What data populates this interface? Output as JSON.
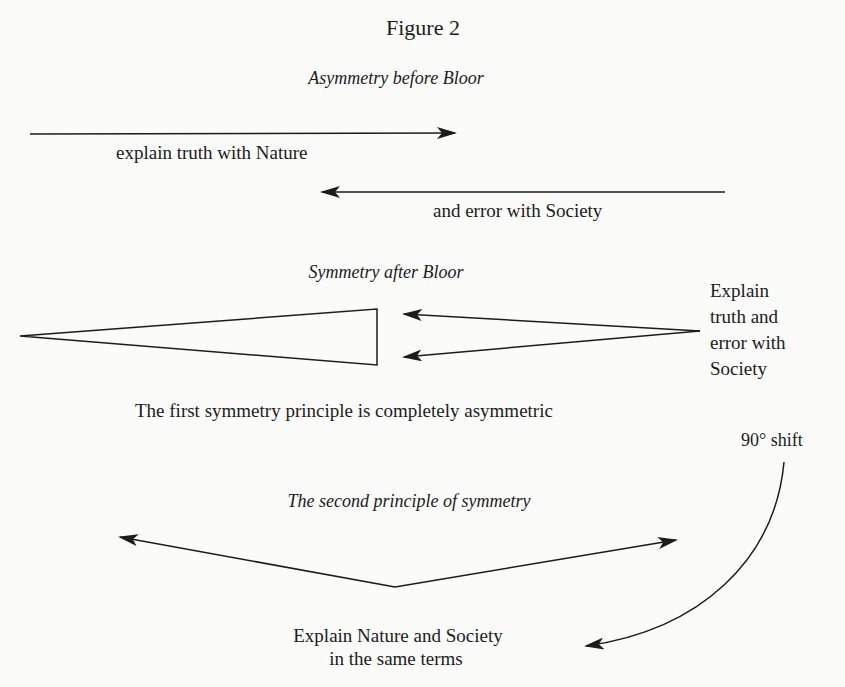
{
  "figure": {
    "title": "Figure 2"
  },
  "section1": {
    "heading": "Asymmetry before Bloor",
    "arrow_right_label": "explain truth with Nature",
    "arrow_left_label": "and error with Society"
  },
  "section2": {
    "heading": "Symmetry after Bloor",
    "side_label": "Explain\ntruth and\nerror with\nSociety",
    "caption": "The first symmetry principle is completely asymmetric"
  },
  "shift": {
    "label": "90° shift"
  },
  "section3": {
    "heading": "The second principle of symmetry",
    "caption_line1": "Explain Nature and Society",
    "caption_line2": "in the same terms"
  },
  "colors": {
    "background": "#fbfbfa",
    "ink": "#1c1c1c"
  }
}
